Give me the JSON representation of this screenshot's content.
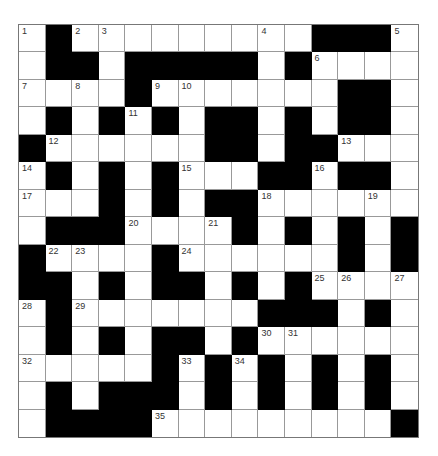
{
  "puzzle": {
    "rows": 15,
    "cols": 15,
    "grid": [
      "W.WWWWWWWWW...W",
      "W..W.....W.WWWW",
      "WWWW.WWWWWWW..W",
      "W.W.W.W..W.W..W",
      ".WWWWWW..W..WWW",
      "W.W.W.WWW..W..W",
      "WWW.W.W..WWWWWW",
      "W...WWWW.W.W.W.",
      ".WWWW.WWWWWW.W.",
      "..W.W..W.W.WWWW",
      "W.WWWWWWW...W.W",
      "W.W.W..W.WWWWWW",
      "WWWWW.W.W.W.W.W",
      "W.W...W.W.W.W.W",
      "W....WWWWWWWWW."
    ],
    "numbers": [
      {
        "n": "1",
        "r": 0,
        "c": 0
      },
      {
        "n": "2",
        "r": 0,
        "c": 2
      },
      {
        "n": "3",
        "r": 0,
        "c": 3
      },
      {
        "n": "4",
        "r": 0,
        "c": 9
      },
      {
        "n": "5",
        "r": 0,
        "c": 14
      },
      {
        "n": "6",
        "r": 1,
        "c": 11
      },
      {
        "n": "7",
        "r": 2,
        "c": 0
      },
      {
        "n": "8",
        "r": 2,
        "c": 2
      },
      {
        "n": "9",
        "r": 2,
        "c": 5
      },
      {
        "n": "10",
        "r": 2,
        "c": 6
      },
      {
        "n": "11",
        "r": 3,
        "c": 4
      },
      {
        "n": "12",
        "r": 4,
        "c": 1
      },
      {
        "n": "13",
        "r": 4,
        "c": 12
      },
      {
        "n": "14",
        "r": 5,
        "c": 0
      },
      {
        "n": "15",
        "r": 5,
        "c": 6
      },
      {
        "n": "16",
        "r": 5,
        "c": 11
      },
      {
        "n": "17",
        "r": 6,
        "c": 0
      },
      {
        "n": "18",
        "r": 6,
        "c": 9
      },
      {
        "n": "19",
        "r": 6,
        "c": 13
      },
      {
        "n": "20",
        "r": 7,
        "c": 4
      },
      {
        "n": "21",
        "r": 7,
        "c": 7
      },
      {
        "n": "22",
        "r": 8,
        "c": 1
      },
      {
        "n": "23",
        "r": 8,
        "c": 2
      },
      {
        "n": "24",
        "r": 8,
        "c": 6
      },
      {
        "n": "25",
        "r": 9,
        "c": 11
      },
      {
        "n": "26",
        "r": 9,
        "c": 12
      },
      {
        "n": "27",
        "r": 9,
        "c": 14
      },
      {
        "n": "28",
        "r": 10,
        "c": 0
      },
      {
        "n": "29",
        "r": 10,
        "c": 2
      },
      {
        "n": "30",
        "r": 11,
        "c": 9
      },
      {
        "n": "31",
        "r": 11,
        "c": 10
      },
      {
        "n": "32",
        "r": 12,
        "c": 0
      },
      {
        "n": "33",
        "r": 12,
        "c": 6
      },
      {
        "n": "34",
        "r": 12,
        "c": 8
      },
      {
        "n": "35",
        "r": 14,
        "c": 5
      }
    ],
    "colors": {
      "block": "#000000",
      "cell": "#ffffff",
      "grid_line": "#999999",
      "number": "#333333"
    }
  }
}
